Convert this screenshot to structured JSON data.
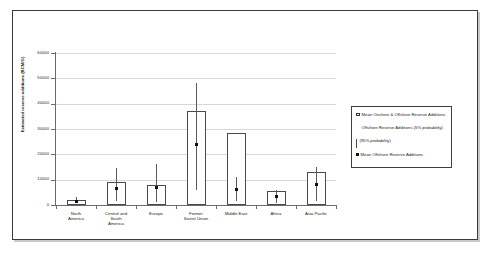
{
  "chart_data": {
    "type": "bar",
    "title": "",
    "subtitle": "",
    "xlabel": "",
    "ylabel": "Estimated reserve additions (BCM/G)",
    "ylim": [
      0,
      60000
    ],
    "ytick_values": [
      0,
      10000,
      20000,
      30000,
      40000,
      50000,
      60000
    ],
    "ytick_labels": [
      "0",
      "10000",
      "20000",
      "30000",
      "40000",
      "50000",
      "60000"
    ],
    "grid": "horizontal",
    "legend_position": "right",
    "categories": [
      "North America",
      "Central and South America",
      "Europe",
      "Former Soviet Union",
      "Middle East",
      "Africa",
      "Asia Pacific"
    ],
    "category_label_lines": [
      [
        "North",
        "America"
      ],
      [
        "Central and",
        "South",
        "America"
      ],
      [
        "Europe"
      ],
      [
        "Former",
        "Soviet Union"
      ],
      [
        "Middle East"
      ],
      [
        "Africa"
      ],
      [
        "Asia Pacific"
      ]
    ],
    "series": [
      {
        "name": "Mean Onshore & Offshore Reserve Additions",
        "type": "bar",
        "values": [
          2000,
          9000,
          8000,
          37000,
          28500,
          5500,
          13000
        ]
      },
      {
        "name": "Mean Offshore Reserve Additions",
        "type": "marker",
        "values": [
          1500,
          6500,
          7000,
          24000,
          6000,
          3200,
          8000
        ]
      },
      {
        "name": "Offshore Reserve Additions (5% probability)",
        "type": "errorbar-high",
        "values": [
          3000,
          14500,
          16000,
          48000,
          11000,
          6000,
          15000
        ]
      },
      {
        "name": "Offshore Reserve Additions (95% probability)",
        "type": "errorbar-low",
        "values": [
          700,
          1500,
          1200,
          6000,
          1500,
          700,
          1500
        ]
      }
    ]
  },
  "legend": {
    "entries": [
      {
        "marker": "open-square",
        "label": "Mean Onshore & Offshore Reserve Additions"
      },
      {
        "marker": "none",
        "label": "Offshore Reserve Additions (5% probability)"
      },
      {
        "marker": "vertical-bar",
        "label": "(95% probability)"
      },
      {
        "marker": "filled-square",
        "label": "Mean Offshore Reserve Additions"
      }
    ]
  }
}
